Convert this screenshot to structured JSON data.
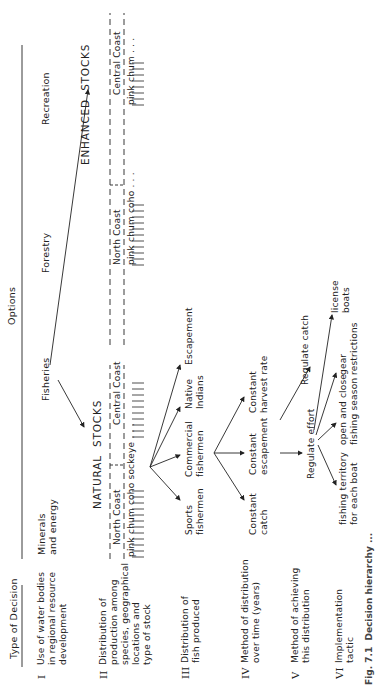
{
  "header": {
    "type_of_decision": "Type of Decision",
    "options": "Options"
  },
  "decisions": [
    {
      "roman": "I",
      "label": "Use of water bodies\nin regional resource\ndevelopment"
    },
    {
      "roman": "II",
      "label": "Distribution of\nproduction among\nspecies, geographical\nlocations and\ntype of stock"
    },
    {
      "roman": "III",
      "label": "Distribution of\nfish produced"
    },
    {
      "roman": "IV",
      "label": "Method of distribution\nover time (years)"
    },
    {
      "roman": "V",
      "label": "Method of achieving\nthis distribution"
    },
    {
      "roman": "VI",
      "label": "Implementation\ntactic"
    }
  ],
  "level1_options": [
    "Minerals\nand energy",
    "Fisheries",
    "Forestry",
    "Recreation"
  ],
  "stocks": {
    "natural": {
      "title": "NATURAL  STOCKS",
      "north_coast": "North Coast",
      "north_species": "pink chum coho sockeye . . .",
      "central_coast": "Central Coast",
      "central_species": "pink chum coho . . ."
    },
    "enhanced": {
      "title": "ENHANCED  STOCKS",
      "north_coast": "North Coast",
      "north_species": "pink chum coho . . .",
      "central_coast": "Central Coast",
      "central_species": "pink chum . . ."
    }
  },
  "level3_options": [
    "Sports\nfishermen",
    "Commercial\nfishermen",
    "Native\nIndians",
    "Escapement"
  ],
  "level4_options": [
    "Constant\ncatch",
    "Constant\nescapement",
    "Constant\nharvest rate"
  ],
  "level5_options": [
    "Regulate effort",
    "Regulate catch"
  ],
  "level6_options": [
    "fishing territory\nfor each boat",
    "open and close\nfishing season",
    "gear\nrestrictions",
    "license\nboats"
  ],
  "caption": "Fig. 7.1  Decision hierarchy ..."
}
